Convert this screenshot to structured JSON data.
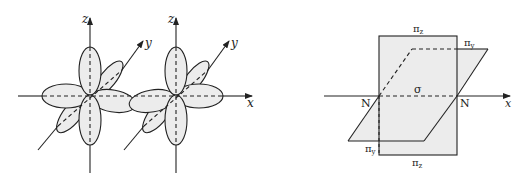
{
  "left_diagram": {
    "description": "Two p-orbital sets (px, py, pz lobes) on adjacent atoms along the x axis",
    "axes": {
      "z1": "z",
      "y1": "y",
      "z2": "z",
      "y2": "y",
      "x": "x"
    }
  },
  "right_diagram": {
    "description": "Nodal planes of the N2 sigma and pi bonds",
    "labels": {
      "pi_z_top": "π",
      "pi_z_top_sub": "z",
      "pi_y_right": "π",
      "pi_y_right_sub": "y",
      "sigma": "σ",
      "n_left": "N",
      "n_right": "N",
      "x_axis": "x",
      "pi_y_bottom": "π",
      "pi_y_bottom_sub": "y",
      "pi_z_bottom": "π",
      "pi_z_bottom_sub": "z"
    }
  },
  "colors": {
    "fill": "#ececec",
    "stroke": "#222222"
  }
}
